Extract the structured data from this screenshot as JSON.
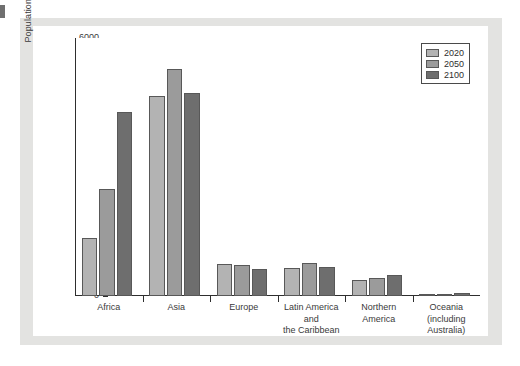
{
  "figure": {
    "background_color": "#e3e3e1",
    "plot_background_color": "#ffffff",
    "axis_color": "#2e2e2e"
  },
  "chart_data": {
    "type": "bar",
    "title": "",
    "xlabel": "",
    "ylabel": "Population (in millions)",
    "ylim": [
      0,
      6000
    ],
    "ytick_labels": [
      "0",
      "1000",
      "2000",
      "3000",
      "4000",
      "5000",
      "6000"
    ],
    "ytick_values": [
      0,
      1000,
      2000,
      3000,
      4000,
      5000,
      6000
    ],
    "minor_tick_interval": 250,
    "grid": false,
    "legend_position": "top-right",
    "categories": [
      "Africa",
      "Asia",
      "Europe",
      "Latin America\nand\nthe Caribbean",
      "Northern\nAmerica",
      "Oceania\n(including\nAustralia)"
    ],
    "series": [
      {
        "name": "2020",
        "color": "#b3b3b3",
        "values": [
          1340,
          4650,
          750,
          650,
          370,
          45
        ]
      },
      {
        "name": "2050",
        "color": "#9b9b9b",
        "values": [
          2490,
          5290,
          710,
          760,
          430,
          55
        ]
      },
      {
        "name": "2100",
        "color": "#6e6e6e",
        "values": [
          4280,
          4720,
          630,
          680,
          490,
          70
        ]
      }
    ]
  }
}
